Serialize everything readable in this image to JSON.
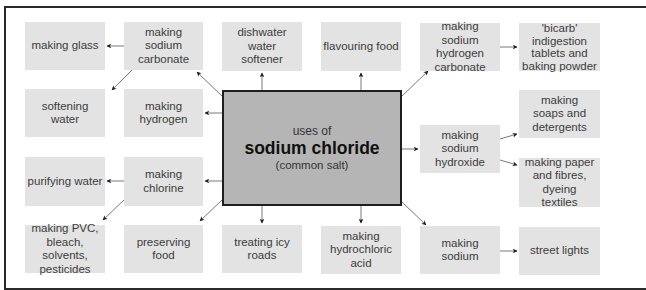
{
  "diagram": {
    "center": {
      "line1": "uses of",
      "line2": "sodium chloride",
      "line3": "(common salt)"
    },
    "boxes": [
      {
        "id": "making-glass",
        "label": "making glass"
      },
      {
        "id": "making-sodium-carbonate",
        "label": "making sodium carbonate"
      },
      {
        "id": "dishwater-water-softener",
        "label": "dishwater water softener"
      },
      {
        "id": "flavouring-food",
        "label": "flavouring food"
      },
      {
        "id": "making-sodium-hydrogen-carbonate",
        "label": "making sodium hydrogen carbonate"
      },
      {
        "id": "bicarb",
        "label": "'bicarb' indigestion tablets and baking powder"
      },
      {
        "id": "softening-water",
        "label": "softening water"
      },
      {
        "id": "making-hydrogen",
        "label": "making hydrogen"
      },
      {
        "id": "making-soaps",
        "label": "making soaps and detergents"
      },
      {
        "id": "making-sodium-hydroxide",
        "label": "making sodium hydroxide"
      },
      {
        "id": "purifying-water",
        "label": "purifying water"
      },
      {
        "id": "making-chlorine",
        "label": "making chlorine"
      },
      {
        "id": "making-paper",
        "label": "making paper and fibres, dyeing textiles"
      },
      {
        "id": "making-pvc",
        "label": "making PVC, bleach, solvents, pesticides"
      },
      {
        "id": "preserving-food",
        "label": "preserving food"
      },
      {
        "id": "treating-icy-roads",
        "label": "treating icy roads"
      },
      {
        "id": "making-hydrochloric-acid",
        "label": "making hydrochloric acid"
      },
      {
        "id": "making-sodium",
        "label": "making sodium"
      },
      {
        "id": "street-lights",
        "label": "street lights"
      }
    ],
    "connections": [
      [
        "sodium-chloride",
        "making-sodium-carbonate"
      ],
      [
        "making-sodium-carbonate",
        "making-glass"
      ],
      [
        "making-sodium-carbonate",
        "softening-water"
      ],
      [
        "sodium-chloride",
        "dishwater-water-softener"
      ],
      [
        "sodium-chloride",
        "flavouring-food"
      ],
      [
        "sodium-chloride",
        "making-sodium-hydrogen-carbonate"
      ],
      [
        "making-sodium-hydrogen-carbonate",
        "bicarb"
      ],
      [
        "sodium-chloride",
        "making-hydrogen"
      ],
      [
        "sodium-chloride",
        "making-sodium-hydroxide"
      ],
      [
        "making-sodium-hydroxide",
        "making-soaps"
      ],
      [
        "making-sodium-hydroxide",
        "making-paper"
      ],
      [
        "sodium-chloride",
        "making-chlorine"
      ],
      [
        "making-chlorine",
        "purifying-water"
      ],
      [
        "making-chlorine",
        "making-pvc"
      ],
      [
        "sodium-chloride",
        "preserving-food"
      ],
      [
        "sodium-chloride",
        "treating-icy-roads"
      ],
      [
        "sodium-chloride",
        "making-hydrochloric-acid"
      ],
      [
        "sodium-chloride",
        "making-sodium"
      ],
      [
        "making-sodium",
        "street-lights"
      ]
    ],
    "colors": {
      "box_fill": "#e3e3e3",
      "center_fill": "#b5b5b5",
      "border": "#1e1e1e",
      "arrow": "#1a1a1a"
    }
  }
}
